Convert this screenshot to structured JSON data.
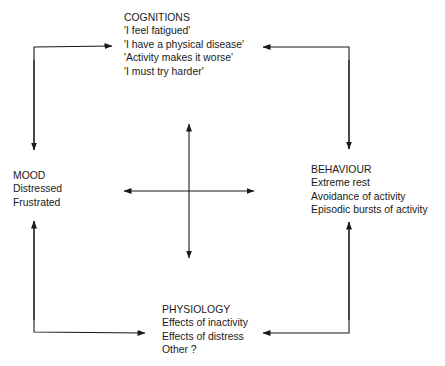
{
  "diagram": {
    "type": "cycle-diagram",
    "nodes": {
      "cognitions": {
        "title": "COGNITIONS",
        "items": [
          "'I feel fatigued'",
          "'I have a physical disease'",
          "'Activity makes it worse'",
          "'I must try harder'"
        ]
      },
      "mood": {
        "title": "MOOD",
        "items": [
          "Distressed",
          "Frustrated"
        ]
      },
      "behaviour": {
        "title": "BEHAVIOUR",
        "items": [
          "Extreme rest",
          "Avoidance of activity",
          "Episodic bursts of activity"
        ]
      },
      "physiology": {
        "title": "PHYSIOLOGY",
        "items": [
          "Effects of inactivity",
          "Effects of distress",
          "Other ?"
        ]
      }
    },
    "edges": [
      {
        "from": "mood",
        "to": "cognitions",
        "bidirectional": true
      },
      {
        "from": "behaviour",
        "to": "cognitions",
        "bidirectional": true
      },
      {
        "from": "mood",
        "to": "physiology",
        "bidirectional": true
      },
      {
        "from": "behaviour",
        "to": "physiology",
        "bidirectional": true
      },
      {
        "center_cross": "four-way double-headed arrows linking all nodes"
      }
    ],
    "colors": {
      "line": "#1a1a1a",
      "text": "#1a1a1a",
      "background": "#ffffff"
    }
  }
}
